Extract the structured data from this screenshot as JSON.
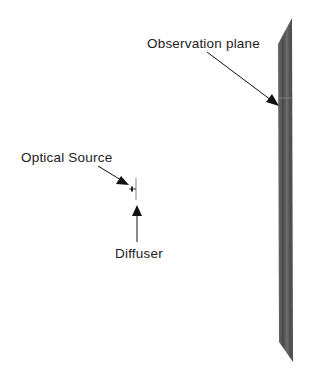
{
  "diagram": {
    "labels": {
      "observation_plane": "Observation plane",
      "optical_source": "Optical Source",
      "diffuser": "Diffuser"
    },
    "colors": {
      "plane_fill": "#5a5a5a",
      "plane_dark": "#444444",
      "arrow": "#111111",
      "text": "#222222"
    }
  }
}
